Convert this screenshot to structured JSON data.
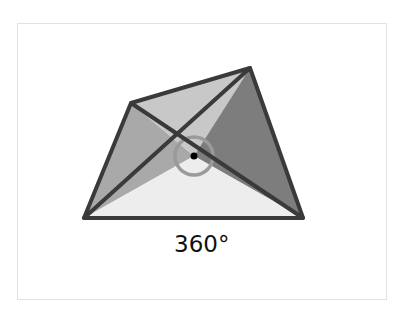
{
  "diagram": {
    "label": "360°",
    "vertices": {
      "top_left": [
        131,
        103
      ],
      "top_right": [
        250,
        68
      ],
      "bottom_right": [
        303,
        218
      ],
      "bottom_left": [
        84,
        218
      ],
      "center": [
        194,
        156
      ]
    },
    "colors": {
      "stroke": "#3a3a3a",
      "left": "#a9a9a9",
      "top": "#c8c8c8",
      "right": "#7d7d7d",
      "bottom": "#ededed",
      "circle": "#9a9a9a"
    }
  }
}
